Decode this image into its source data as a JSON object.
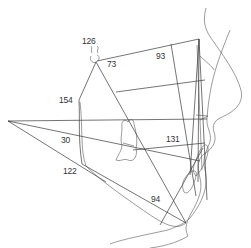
{
  "diagram": {
    "type": "cephalometric-tracing",
    "line_color": "#3a3a3a",
    "background": "#ffffff",
    "angle_labels": [
      {
        "id": "sella",
        "value": "126",
        "x": 82,
        "y": 37
      },
      {
        "id": "n-s-ar",
        "value": "73",
        "x": 107,
        "y": 60
      },
      {
        "id": "nasion",
        "value": "93",
        "x": 156,
        "y": 52
      },
      {
        "id": "articulare",
        "value": "154",
        "x": 59,
        "y": 96
      },
      {
        "id": "fmpa",
        "value": "30",
        "x": 61,
        "y": 135
      },
      {
        "id": "gonial",
        "value": "122",
        "x": 63,
        "y": 166
      },
      {
        "id": "interincisal",
        "value": "131",
        "x": 166,
        "y": 135
      },
      {
        "id": "impa",
        "value": "94",
        "x": 151,
        "y": 195
      }
    ]
  }
}
